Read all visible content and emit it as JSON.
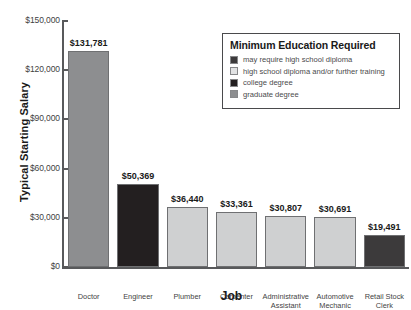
{
  "chart_data": {
    "type": "bar",
    "title": "",
    "xlabel": "Job",
    "ylabel": "Typical Starting Salary",
    "ylim": [
      0,
      150000
    ],
    "yticks": [
      "$0",
      "$30,000",
      "$60,000",
      "$90,000",
      "$120,000",
      "$150,000"
    ],
    "ytick_values": [
      0,
      30000,
      60000,
      90000,
      120000,
      150000
    ],
    "grid": false,
    "categories": [
      "Doctor",
      "Engineer",
      "Plumber",
      "Carpenter",
      "Administrative Assistant",
      "Automotive Mechanic",
      "Retail Stock Clerk"
    ],
    "values": [
      131781,
      50369,
      36440,
      33361,
      30807,
      30691,
      19491
    ],
    "value_labels": [
      "$131,781",
      "$50,369",
      "$36,440",
      "$33,361",
      "$30,807",
      "$30,691",
      "$19,491"
    ],
    "bar_colors": [
      "#8d8e90",
      "#231f20",
      "#cfd0d1",
      "#cfd0d1",
      "#cfd0d1",
      "#cfd0d1",
      "#3c3a3b"
    ],
    "bar_categories_education": [
      "graduate degree",
      "college degree",
      "high school diploma and/or further training",
      "high school diploma and/or further training",
      "high school diploma and/or further training",
      "high school diploma and/or further training",
      "may require high school diploma"
    ],
    "legend_position": "top-right",
    "legend": {
      "title": "Minimum Education Required",
      "entries": [
        {
          "label": "may require high school diploma",
          "color": "#3c3a3b"
        },
        {
          "label": "high school diploma and/or further training",
          "color": "#e2e3e4"
        },
        {
          "label": "college degree",
          "color": "#231f20"
        },
        {
          "label": "graduate degree",
          "color": "#8d8e90"
        }
      ]
    }
  }
}
